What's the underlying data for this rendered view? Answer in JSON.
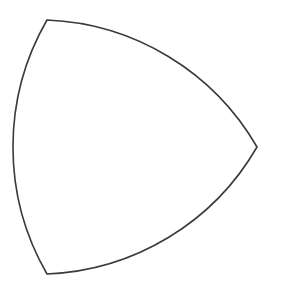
{
  "figure": {
    "background_color": "#ffffff",
    "stroke_color": "#3a3a3a",
    "fill_color": "#ffffff",
    "stroke_width": 1.6,
    "canvas": {
      "width": 281,
      "height": 306
    },
    "shape": {
      "type": "reuleaux-triangle",
      "vertices": [
        {
          "name": "top-left-vertex",
          "x": 47,
          "y": 20
        },
        {
          "name": "right-vertex",
          "x": 257,
          "y": 147
        },
        {
          "name": "bottom-left-vertex",
          "x": 47,
          "y": 274
        }
      ],
      "arcs": [
        {
          "name": "top-right-arc",
          "from": "top-left-vertex",
          "to": "right-vertex",
          "radius": 254,
          "sweep": "clockwise",
          "center_vertex": "bottom-left-vertex"
        },
        {
          "name": "bottom-right-arc",
          "from": "right-vertex",
          "to": "bottom-left-vertex",
          "radius": 254,
          "sweep": "clockwise",
          "center_vertex": "top-left-vertex"
        },
        {
          "name": "left-arc",
          "from": "bottom-left-vertex",
          "to": "top-left-vertex",
          "radius": 254,
          "sweep": "clockwise",
          "center_vertex": "right-vertex"
        }
      ],
      "path_d": "M 47 20 A 254 254 0 0 1 257 147 A 254 254 0 0 1 47 274 A 254 254 0 0 1 47 20 Z",
      "extremes": {
        "leftmost_x": 12,
        "rightmost_x": 257,
        "topmost_y": 19,
        "bottommost_y": 275
      }
    }
  }
}
